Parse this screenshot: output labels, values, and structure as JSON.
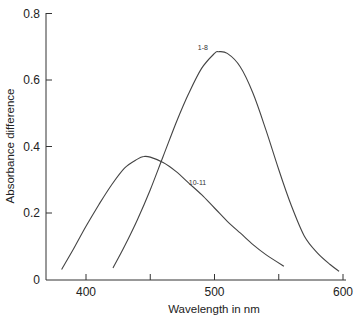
{
  "chart_data": {
    "type": "line",
    "title": "",
    "xlabel": "Wavelength in nm",
    "ylabel": "Absorbance difference",
    "xlim": [
      369,
      620
    ],
    "ylim": [
      0,
      0.8
    ],
    "x_ticks": [
      400,
      450,
      500,
      550,
      600
    ],
    "x_tick_labels": [
      "400",
      "",
      "500",
      "",
      "600"
    ],
    "y_ticks": [
      0,
      0.2,
      0.4,
      0.6,
      0.8
    ],
    "y_tick_labels": [
      "0",
      "0.2",
      "0.4",
      "0.6",
      "0.8"
    ],
    "grid": false,
    "legend": "inline curve labels",
    "series": [
      {
        "name": "10-11",
        "x": [
          381,
          390,
          400,
          410,
          420,
          430,
          440,
          445,
          450,
          460,
          470,
          480,
          490,
          500,
          510,
          520,
          530,
          540,
          554
        ],
        "values": [
          0.03,
          0.09,
          0.16,
          0.225,
          0.285,
          0.335,
          0.362,
          0.37,
          0.368,
          0.352,
          0.325,
          0.29,
          0.255,
          0.215,
          0.175,
          0.14,
          0.105,
          0.075,
          0.04
        ]
      },
      {
        "name": "1-8",
        "x": [
          421,
          430,
          440,
          450,
          460,
          470,
          480,
          490,
          500,
          503,
          510,
          520,
          530,
          540,
          550,
          560,
          570,
          580,
          590,
          597
        ],
        "values": [
          0.035,
          0.1,
          0.18,
          0.27,
          0.37,
          0.47,
          0.56,
          0.635,
          0.68,
          0.685,
          0.68,
          0.64,
          0.56,
          0.45,
          0.33,
          0.22,
          0.13,
          0.08,
          0.045,
          0.025
        ]
      }
    ],
    "annotations": [
      {
        "text": "1-8",
        "x": 487,
        "y": 0.69
      },
      {
        "text": "10-11",
        "x": 480,
        "y": 0.285
      }
    ]
  }
}
